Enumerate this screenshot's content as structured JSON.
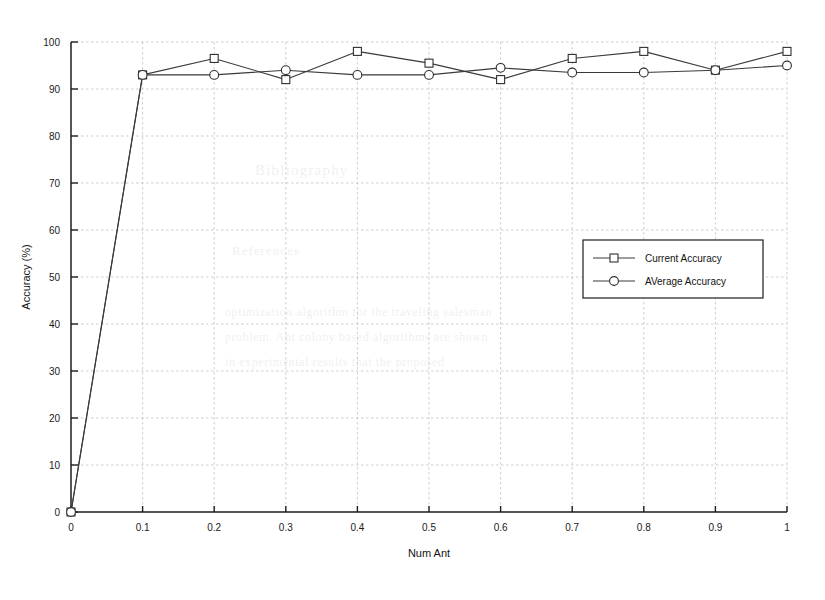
{
  "figure": {
    "background_color": "#ffffff",
    "ink_color": "#1a1a1a",
    "grid_color": "#b9b9b9"
  },
  "chart_data": {
    "type": "line",
    "title": "",
    "xlabel": "Num Ant",
    "ylabel": "Accuracy (%)",
    "xlim": [
      0,
      1
    ],
    "ylim": [
      0,
      100
    ],
    "xticks": [
      0,
      0.1,
      0.2,
      0.3,
      0.4,
      0.5,
      0.6,
      0.7,
      0.8,
      0.9,
      1
    ],
    "xtick_labels": [
      "0",
      "0.1",
      "0.2",
      "0.3",
      "0.4",
      "0.5",
      "0.6",
      "0.7",
      "0.8",
      "0.9",
      "1"
    ],
    "yticks": [
      0,
      10,
      20,
      30,
      40,
      50,
      60,
      70,
      80,
      90,
      100
    ],
    "ytick_labels": [
      "0",
      "10",
      "20",
      "30",
      "40",
      "50",
      "60",
      "70",
      "80",
      "90",
      "100"
    ],
    "grid": true,
    "grid_style": "dotted",
    "legend_position": "center-right",
    "x": [
      0,
      0.1,
      0.2,
      0.3,
      0.4,
      0.5,
      0.6,
      0.7,
      0.8,
      0.9,
      1
    ],
    "series": [
      {
        "name": "Current Accuracy",
        "marker": "square",
        "values": [
          0,
          93,
          96.5,
          92,
          98,
          95.5,
          92,
          96.5,
          98,
          94,
          98
        ]
      },
      {
        "name": "AVerage Accuracy",
        "marker": "circle",
        "values": [
          0,
          93,
          93,
          94,
          93,
          93,
          94.5,
          93.5,
          93.5,
          94,
          95
        ]
      }
    ]
  },
  "legend": {
    "entries": [
      {
        "label": "Current Accuracy",
        "marker": "square"
      },
      {
        "label": "AVerage Accuracy",
        "marker": "circle"
      }
    ]
  }
}
